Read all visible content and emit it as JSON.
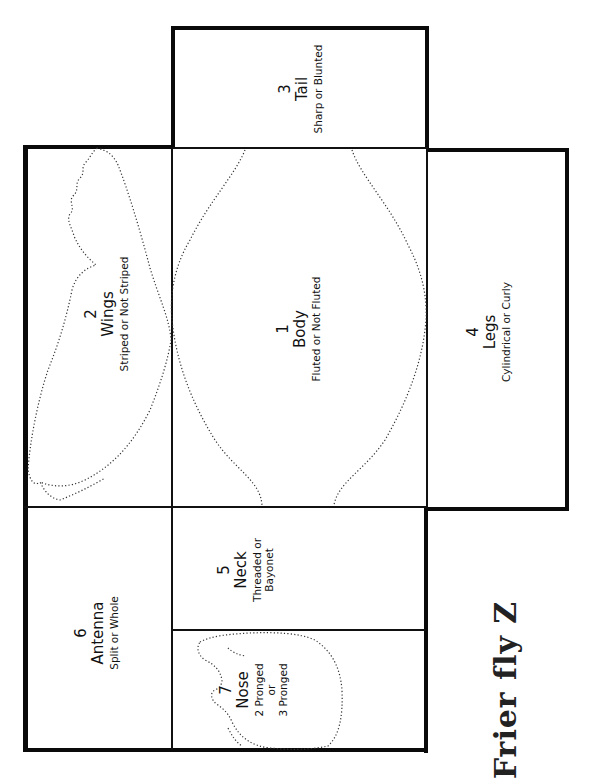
{
  "diagram": {
    "title": "Frier fly Z",
    "panels": {
      "tail": {
        "number": "3",
        "name": "Tail",
        "desc": "Sharp or Blunted"
      },
      "wings": {
        "number": "2",
        "name": "Wings",
        "desc": "Striped or Not Striped"
      },
      "body": {
        "number": "1",
        "name": "Body",
        "desc": "Fluted or Not Fluted"
      },
      "legs": {
        "number": "4",
        "name": "Legs",
        "desc": "Cylindrical or Curly"
      },
      "antenna": {
        "number": "6",
        "name": "Antenna",
        "desc": "Split or Whole"
      },
      "neck": {
        "number": "5",
        "name": "Neck",
        "desc_line1": "Threaded or",
        "desc_line2": "Bayonet"
      },
      "nose": {
        "number": "7",
        "name": "Nose",
        "desc_line1": "2 Pronged",
        "desc_line2": "or",
        "desc_line3": "3 Pronged"
      }
    },
    "colors": {
      "line": "#111111",
      "background": "#ffffff"
    }
  }
}
